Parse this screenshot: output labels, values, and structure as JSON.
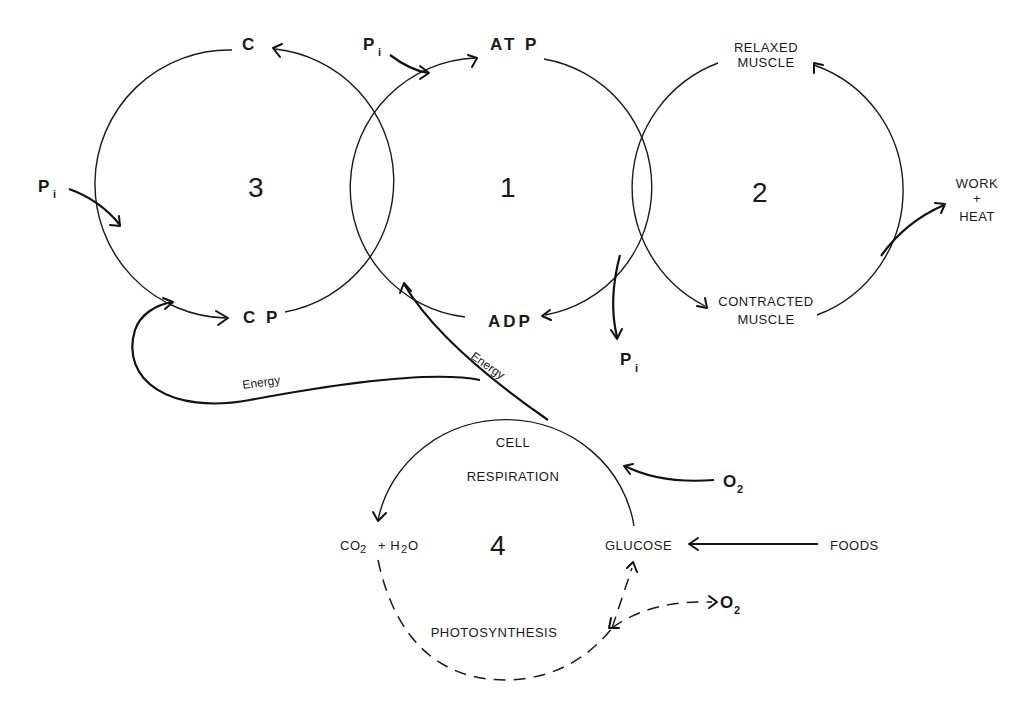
{
  "diagram": {
    "cycles": [
      {
        "id": "1",
        "number": "1"
      },
      {
        "id": "2",
        "number": "2"
      },
      {
        "id": "3",
        "number": "3"
      },
      {
        "id": "4",
        "number": "4"
      }
    ],
    "labels": {
      "c": "C",
      "cp": "C P",
      "atp": "AT P",
      "adp": "ADP",
      "pi": "P",
      "pi_sub": "i",
      "relaxed_1": "RELAXED",
      "relaxed_2": "MUSCLE",
      "contracted_1": "CONTRACTED",
      "contracted_2": "MUSCLE",
      "work": "WORK",
      "plus": "+",
      "heat": "HEAT",
      "energy": "Energy",
      "cell": "CELL",
      "respiration": "RESPIRATION",
      "co2": "CO",
      "co2_sub": "2",
      "plus_h2o": "+ H",
      "h2o_sub": "2",
      "h2o_o": "O",
      "glucose": "GLUCOSE",
      "foods": "FOODS",
      "o2": "O",
      "o2_sub": "2",
      "photosynthesis": "PHOTOSYNTHESIS"
    },
    "colors": {
      "ink": "#1a1a1a",
      "background": "#ffffff"
    }
  }
}
